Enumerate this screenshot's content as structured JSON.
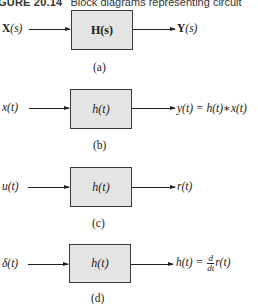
{
  "caption": {
    "figure_label": "GURE 20.14",
    "text": "Block diagrams representing circuit"
  },
  "diagrams": [
    {
      "id": "a",
      "input": "X(s)",
      "input_parts": {
        "sym": "X",
        "arg": "(s)"
      },
      "block": "H(s)",
      "output": "Y(s)",
      "output_parts": {
        "sym": "Y",
        "arg": "(s)"
      },
      "sublabel": "(a)"
    },
    {
      "id": "b",
      "input": "x(t)",
      "block": "h(t)",
      "output": "y(t) = h(t)∗x(t)",
      "sublabel": "(b)"
    },
    {
      "id": "c",
      "input": "u(t)",
      "block": "h(t)",
      "output": "r(t)",
      "sublabel": "(c)"
    },
    {
      "id": "d",
      "input": "δ(t)",
      "block": "h(t)",
      "output_lhs": "h(t) =",
      "output_frac_num": "d",
      "output_frac_den": "dt",
      "output_rhs": "r(t)",
      "sublabel": "(d)"
    }
  ],
  "colors": {
    "block_fill": "#e4e4e4",
    "line": "#222222",
    "background": "#ffffff"
  }
}
